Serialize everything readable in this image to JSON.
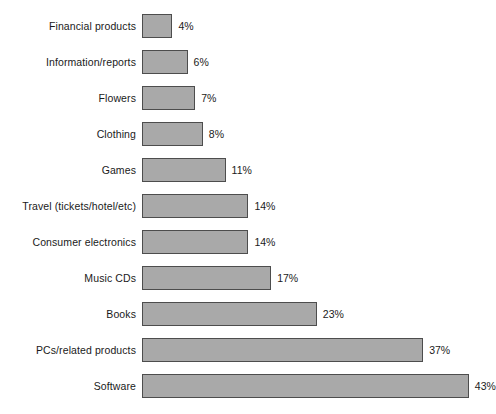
{
  "chart_data": {
    "type": "bar",
    "orientation": "horizontal",
    "title": "",
    "xlabel": "",
    "ylabel": "",
    "xlim": [
      0,
      46
    ],
    "grid": false,
    "legend": null,
    "value_suffix": "%",
    "categories": [
      "Financial products",
      "Information/reports",
      "Flowers",
      "Clothing",
      "Games",
      "Travel (tickets/hotel/etc)",
      "Consumer electronics",
      "Music CDs",
      "Books",
      "PCs/related products",
      "Software"
    ],
    "values": [
      4,
      6,
      7,
      8,
      11,
      14,
      14,
      17,
      23,
      37,
      43
    ],
    "value_labels": [
      "4%",
      "6%",
      "7%",
      "8%",
      "11%",
      "14%",
      "14%",
      "17%",
      "23%",
      "37%",
      "43%"
    ],
    "colors": {
      "bar_fill": "#a9a9a9",
      "bar_border": "#4d4d4d",
      "background": "#ffffff",
      "text": "#1a1a1a"
    }
  },
  "layout": {
    "bar_origin_x": 142,
    "px_per_unit": 7.6,
    "row_pitch": 36,
    "first_bar_top": 14,
    "bar_height": 24
  }
}
